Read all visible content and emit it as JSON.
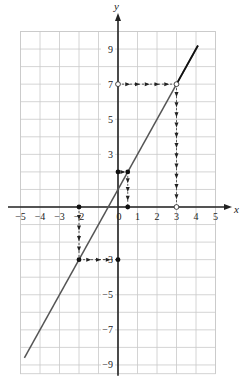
{
  "chart_data": {
    "type": "line",
    "title": "",
    "xlabel": "x",
    "ylabel": "y",
    "xlim": [
      -5,
      5
    ],
    "ylim": [
      -9.5,
      10
    ],
    "grid": true,
    "x_ticks": [
      {
        "v": -5,
        "label": "−5"
      },
      {
        "v": -4,
        "label": "−4"
      },
      {
        "v": -3,
        "label": "−3"
      },
      {
        "v": -2,
        "label": "−2"
      },
      {
        "v": 0,
        "label": "0"
      },
      {
        "v": 1,
        "label": "1"
      },
      {
        "v": 2,
        "label": "2"
      },
      {
        "v": 3,
        "label": "3"
      },
      {
        "v": 4,
        "label": "4"
      },
      {
        "v": 5,
        "label": "5"
      }
    ],
    "y_ticks": [
      {
        "v": 9,
        "label": "9"
      },
      {
        "v": 7,
        "label": "7"
      },
      {
        "v": 5,
        "label": "5"
      },
      {
        "v": 3,
        "label": "3"
      },
      {
        "v": -3,
        "label": "−3"
      },
      {
        "v": -5,
        "label": "−5"
      },
      {
        "v": -7,
        "label": "−7"
      },
      {
        "v": -9,
        "label": "−9"
      }
    ],
    "series": [
      {
        "name": "y = 2x + 1",
        "x": [
          -4.8,
          4.1
        ],
        "y": [
          -8.6,
          9.2
        ],
        "color": "#555555"
      }
    ],
    "points": [
      {
        "x": 0,
        "y": 2,
        "style": "filled"
      },
      {
        "x": 0.5,
        "y": 2,
        "style": "filled"
      },
      {
        "x": 0.5,
        "y": 0,
        "style": "filled"
      },
      {
        "x": -2,
        "y": 0,
        "style": "filled"
      },
      {
        "x": -2,
        "y": -3,
        "style": "filled"
      },
      {
        "x": 0,
        "y": -3,
        "style": "filled"
      },
      {
        "x": 0,
        "y": 7,
        "style": "open"
      },
      {
        "x": 3,
        "y": 7,
        "style": "open"
      },
      {
        "x": 3,
        "y": 0,
        "style": "open"
      }
    ],
    "annotations": [
      {
        "type": "dashed-arrow-path",
        "path": [
          [
            0,
            7
          ],
          [
            3,
            7
          ],
          [
            3,
            0
          ]
        ]
      },
      {
        "type": "dashed-arrow-path",
        "path": [
          [
            0,
            2
          ],
          [
            0.5,
            2
          ],
          [
            0.5,
            0
          ]
        ]
      },
      {
        "type": "dashed-arrow-path",
        "path": [
          [
            -2,
            0
          ],
          [
            -2,
            -3
          ],
          [
            0,
            -3
          ]
        ]
      }
    ]
  }
}
